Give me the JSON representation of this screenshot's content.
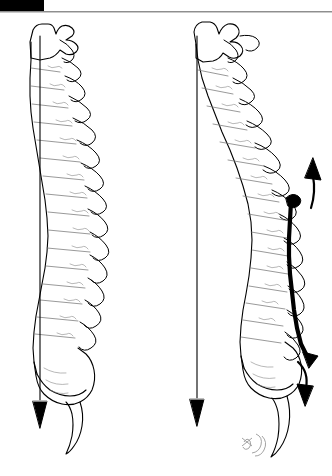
{
  "page": {
    "title": "Lateral spine posture comparison with plumb line",
    "background_color": "#ffffff",
    "ink_color": "#000000",
    "width": 332,
    "height": 476
  },
  "header": {
    "black_tab_label": "",
    "rule_color": "#8e8e8e",
    "tab_color": "#000000"
  },
  "figures": [
    {
      "id": "left-figure",
      "name": "normal-spine-figure",
      "label": "",
      "description": "Lateral view of spine with normal sagittal curves and vertical plumb line",
      "plumb_line": {
        "name": "plumb-line",
        "x": 40,
        "top_y": 36,
        "bottom_y": 400,
        "bob_label": ""
      },
      "annotations": []
    },
    {
      "id": "right-figure",
      "name": "kyphotic-spine-figure",
      "label": "",
      "description": "Lateral view of spine with increased thoracic kyphosis, anterior shift relative to plumb line",
      "plumb_line": {
        "name": "plumb-line",
        "x": 197,
        "top_y": 36,
        "bottom_y": 398,
        "bob_label": ""
      },
      "annotations": [
        {
          "name": "upward-arrow",
          "label": "",
          "direction": "up",
          "x": 310,
          "y": 175
        },
        {
          "name": "downward-arrow",
          "label": "",
          "direction": "down",
          "x": 305,
          "y": 385
        },
        {
          "name": "posterior-tension-line",
          "label": "",
          "direction": "vertical",
          "x": 289,
          "y": 255
        }
      ]
    }
  ],
  "signature": {
    "name": "artist-signature",
    "text": "",
    "x": 248,
    "y": 443
  },
  "colors": {
    "ink": "#000000",
    "rule": "#8e8e8e",
    "rule_light": "#c9c9c9",
    "background": "#ffffff",
    "faint_detail": "#5a5a5a"
  }
}
